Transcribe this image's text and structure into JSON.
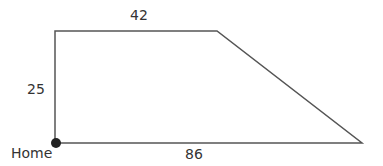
{
  "diagram": {
    "type": "trapezoid-route",
    "labels": {
      "top": "42",
      "left": "25",
      "bottom": "86",
      "home": "Home"
    },
    "colors": {
      "line": "#555555",
      "dot": "#222222",
      "text": "#333333"
    }
  }
}
